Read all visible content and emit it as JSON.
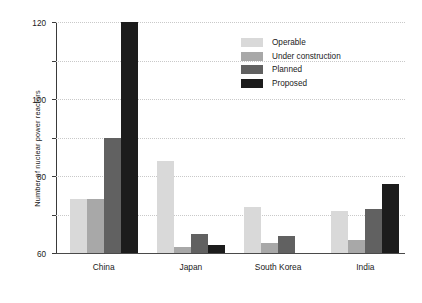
{
  "chart_data": {
    "type": "bar",
    "title": "",
    "xlabel": "",
    "ylabel": "Number of nuclear power reactors",
    "categories": [
      "China",
      "Japan",
      "South Korea",
      "India"
    ],
    "series": [
      {
        "name": "Operable",
        "color": "#d9d9d9",
        "values": [
          28,
          48,
          24,
          22
        ]
      },
      {
        "name": "Under construction",
        "color": "#a8a8a8",
        "values": [
          28,
          3,
          5,
          7
        ]
      },
      {
        "name": "Planned",
        "color": "#616161",
        "values": [
          60,
          10,
          9,
          23
        ]
      },
      {
        "name": "Proposed",
        "color": "#1c1c1c",
        "values": [
          120,
          4,
          0,
          36
        ]
      }
    ],
    "ylim": [
      0,
      120
    ],
    "yticks": [
      0,
      20,
      40,
      60,
      80,
      100,
      120
    ],
    "grid": true,
    "legend_position": "top-right",
    "background_color": "#ffffff",
    "gridline_color": "#c9c9c9",
    "axis_color": "#3a3a3a"
  }
}
